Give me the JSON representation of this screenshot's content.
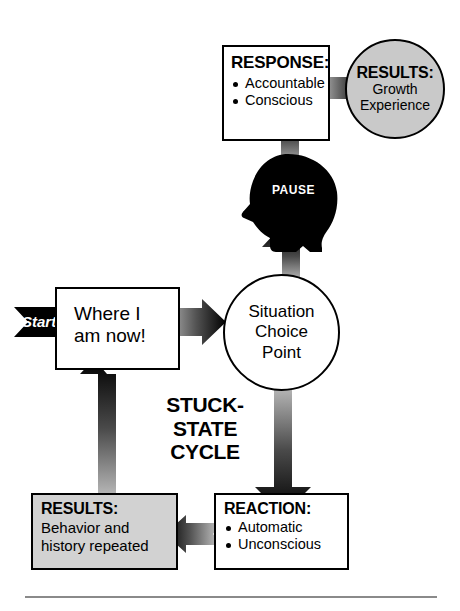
{
  "diagram": {
    "title_label": "STUCK-STATE CYCLE",
    "cycle_label_lines": [
      "STUCK-",
      "STATE",
      "CYCLE"
    ],
    "colors": {
      "ink": "#000000",
      "box_fill": "#ffffff",
      "shaded_fill": "#d2d2d2",
      "circle_shaded_fill": "#c9c9c9",
      "divider": "#8a8a8a"
    },
    "nodes": {
      "response": {
        "heading": "RESPONSE:",
        "bullets": [
          "Accountable",
          "Conscious"
        ]
      },
      "results_growth": {
        "heading": "RESULTS:",
        "lines": [
          "Growth",
          "Experience"
        ]
      },
      "pause_head": {
        "label": "PAUSE"
      },
      "where_i_am_now": {
        "lines": [
          "Where I",
          "am now!"
        ]
      },
      "situation_choice_point": {
        "lines": [
          "Situation",
          "Choice",
          "Point"
        ]
      },
      "reaction": {
        "heading": "REACTION:",
        "bullets": [
          "Automatic",
          "Unconscious"
        ]
      },
      "results_repeated": {
        "heading": "RESULTS:",
        "lines": [
          "Behavior and",
          "history repeated"
        ]
      }
    },
    "start_arrow": {
      "label": "Start"
    },
    "connectors": [
      {
        "name": "start-to-where",
        "from": "start",
        "to": "where_i_am_now",
        "direction": "right"
      },
      {
        "name": "where-to-situation",
        "from": "where_i_am_now",
        "to": "situation_choice_point",
        "direction": "right"
      },
      {
        "name": "situation-to-pause",
        "from": "situation_choice_point",
        "to": "pause_head",
        "direction": "up"
      },
      {
        "name": "pause-to-response",
        "from": "pause_head",
        "to": "response",
        "direction": "up"
      },
      {
        "name": "response-to-results",
        "from": "response",
        "to": "results_growth",
        "direction": "right"
      },
      {
        "name": "situation-to-reaction",
        "from": "situation_choice_point",
        "to": "reaction",
        "direction": "down"
      },
      {
        "name": "reaction-to-results",
        "from": "reaction",
        "to": "results_repeated",
        "direction": "left"
      },
      {
        "name": "results-to-where",
        "from": "results_repeated",
        "to": "where_i_am_now",
        "direction": "up"
      }
    ]
  }
}
